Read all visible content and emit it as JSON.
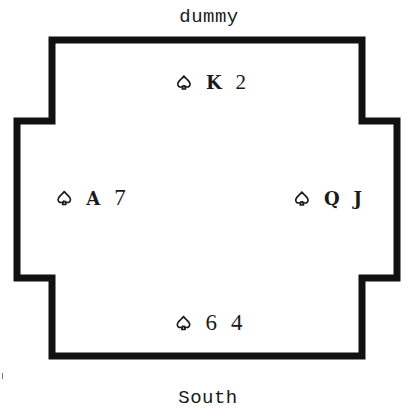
{
  "diagram": {
    "colors": {
      "line": "#111111",
      "text": "#1a1a1a",
      "background": "#ffffff"
    },
    "seats": {
      "north": {
        "label": "dummy",
        "suit_icon": "spade-outline-icon",
        "cards": [
          "K",
          "2"
        ]
      },
      "west": {
        "label": "",
        "suit_icon": "spade-outline-icon",
        "cards": [
          "A",
          "7"
        ]
      },
      "east": {
        "label": "",
        "suit_icon": "spade-outline-icon",
        "cards": [
          "Q",
          "J"
        ]
      },
      "south": {
        "label": "South",
        "suit_icon": "spade-outline-icon",
        "cards": [
          "6",
          "4"
        ]
      }
    }
  }
}
